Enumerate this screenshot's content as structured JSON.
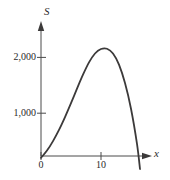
{
  "chart_data": {
    "type": "line",
    "title": "",
    "subtitle": "",
    "xlabel": "x",
    "ylabel": "S",
    "xlim": [
      0,
      18.5
    ],
    "ylim": [
      0,
      2600
    ],
    "grid": false,
    "legend": null,
    "axis_arrows": true,
    "xticks": [
      {
        "value": 0,
        "label": "0"
      },
      {
        "value": 10,
        "label": "10"
      }
    ],
    "yticks": [
      {
        "value": 1000,
        "label": "1,000"
      },
      {
        "value": 2000,
        "label": "2,000"
      }
    ],
    "series": [
      {
        "name": "S",
        "color": "#3c3a3a",
        "x": [
          0,
          1,
          2,
          3,
          4,
          5,
          6,
          7,
          8,
          9,
          10,
          11,
          12,
          13,
          14,
          15,
          16,
          16.5
        ],
        "y": [
          200,
          330,
          500,
          700,
          930,
          1180,
          1440,
          1690,
          1910,
          2070,
          2150,
          2155,
          2070,
          1870,
          1540,
          1080,
          450,
          0
        ]
      }
    ],
    "annotations": {
      "peak_x": 11,
      "peak_y": 2155,
      "x_intercept": 16.5,
      "y_intercept": 200
    }
  },
  "axes": {
    "y_title": "S",
    "x_title": "x"
  },
  "colors": {
    "curve": "#3c3a3a",
    "axis": "#4a4a4a",
    "text": "#2b2b2b",
    "background": "#ffffff"
  }
}
